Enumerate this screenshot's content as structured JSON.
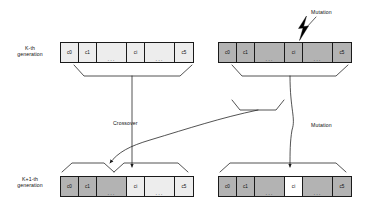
{
  "diagram": {
    "colors": {
      "stroke": "#1a1a1a",
      "light_gene": "#ededed",
      "mid_gene": "#d9d9d9",
      "dark_gene": "#b3b3b3",
      "white_gene": "#ffffff",
      "background": "#ffffff",
      "text": "#111111"
    }
  },
  "rows": [
    {
      "id": "k-generation",
      "label_line1": "K-th",
      "label_line2": "generation",
      "chromosomes": [
        {
          "id": "parent-a",
          "cells": [
            {
              "label": "c0",
              "shade": "light",
              "width": 18,
              "dots": ""
            },
            {
              "label": "c1",
              "shade": "light",
              "width": 18,
              "dots": ""
            },
            {
              "label": "",
              "shade": "light",
              "width": 30,
              "dots": "..."
            },
            {
              "label": "ci",
              "shade": "light",
              "width": 18,
              "dots": ""
            },
            {
              "label": "",
              "shade": "light",
              "width": 30,
              "dots": "..."
            },
            {
              "label": "c5",
              "shade": "light",
              "width": 18,
              "dots": ""
            }
          ]
        },
        {
          "id": "parent-b",
          "cells": [
            {
              "label": "c0",
              "shade": "dark",
              "width": 18,
              "dots": ""
            },
            {
              "label": "c1",
              "shade": "dark",
              "width": 18,
              "dots": ""
            },
            {
              "label": "",
              "shade": "dark",
              "width": 30,
              "dots": "..."
            },
            {
              "label": "ci",
              "shade": "dark",
              "width": 18,
              "dots": ""
            },
            {
              "label": "",
              "shade": "dark",
              "width": 30,
              "dots": "..."
            },
            {
              "label": "c5",
              "shade": "dark",
              "width": 18,
              "dots": ""
            }
          ]
        }
      ]
    },
    {
      "id": "k-plus-1-generation",
      "label_line1": "K+1-th",
      "label_line2": "generation",
      "chromosomes": [
        {
          "id": "child-a",
          "cells": [
            {
              "label": "c0",
              "shade": "dark",
              "width": 18,
              "dots": ""
            },
            {
              "label": "c1",
              "shade": "dark",
              "width": 18,
              "dots": ""
            },
            {
              "label": "",
              "shade": "dark",
              "width": 30,
              "dots": "..."
            },
            {
              "label": "ci",
              "shade": "light",
              "width": 18,
              "dots": ""
            },
            {
              "label": "",
              "shade": "light",
              "width": 30,
              "dots": "..."
            },
            {
              "label": "c5",
              "shade": "light",
              "width": 18,
              "dots": ""
            }
          ]
        },
        {
          "id": "child-b",
          "cells": [
            {
              "label": "c0",
              "shade": "dark",
              "width": 18,
              "dots": ""
            },
            {
              "label": "c1",
              "shade": "dark",
              "width": 18,
              "dots": ""
            },
            {
              "label": "",
              "shade": "dark",
              "width": 30,
              "dots": "..."
            },
            {
              "label": "ci",
              "shade": "white",
              "width": 18,
              "dots": ""
            },
            {
              "label": "",
              "shade": "dark",
              "width": 30,
              "dots": "..."
            },
            {
              "label": "c5",
              "shade": "dark",
              "width": 18,
              "dots": ""
            }
          ]
        }
      ]
    }
  ],
  "annotations": {
    "mutation_top": "Mutation",
    "crossover": "Crossover",
    "mutation_mid": "Mutation"
  }
}
